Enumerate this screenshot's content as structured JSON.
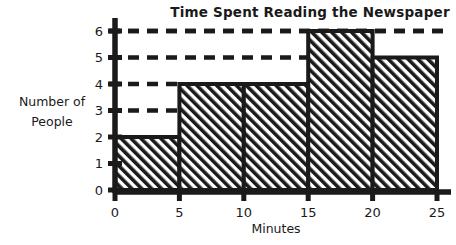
{
  "chart_data": {
    "type": "bar",
    "title": "Time Spent Reading the Newspaper",
    "xlabel": "Minutes",
    "ylabel": "Number of People",
    "ylabel_lines": [
      "Number of",
      "People"
    ],
    "categories": [
      "0-5",
      "5-10",
      "10-15",
      "15-20",
      "20-25"
    ],
    "bin_edges": [
      0,
      5,
      10,
      15,
      20,
      25
    ],
    "values": [
      2,
      4,
      4,
      6,
      5
    ],
    "x_tick_labels": [
      "0",
      "5",
      "10",
      "15",
      "20",
      "25"
    ],
    "y_tick_labels": [
      "0",
      "1",
      "2",
      "3",
      "4",
      "5",
      "6"
    ],
    "xlim": [
      0,
      25
    ],
    "ylim": [
      0,
      6
    ],
    "grid": true,
    "gridlines": [
      3,
      4,
      5,
      6
    ],
    "gridline_style": "dashed",
    "legend": null,
    "bar_fill": "diagonal-hatch",
    "colors": {
      "ink": "#1a1a1a",
      "background": "#ffffff",
      "bar_outline": "#1a1a1a",
      "gridline": "#1a1a1a"
    }
  },
  "axes": {
    "y_title_line1": "Number of",
    "y_title_line2": "People"
  }
}
